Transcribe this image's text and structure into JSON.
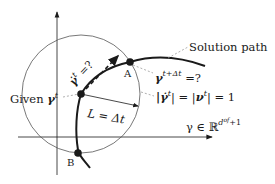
{
  "diagram": {
    "labels": {
      "solution_path": "Solution path",
      "given_prefix": "Given ",
      "given_symbol": "γ",
      "given_sup": "t",
      "next_point_symbol": "γ",
      "next_point_sup": "t+Δt",
      "next_point_suffix": " =?",
      "tangent_symbol": "γ̇",
      "tangent_sup": "t",
      "tangent_suffix": " =?",
      "norm_text_a": "|γ̇",
      "norm_sup_a": "t",
      "norm_text_b": "| = |",
      "norm_nu": "ν",
      "norm_sup_b": "t",
      "norm_text_c": "| = 1",
      "step_length": "L = Δt",
      "space_prefix": "γ ∈ ℝ",
      "space_sup": "d",
      "space_sup2": "of",
      "space_suffix": "+1",
      "point_a": "A",
      "point_b": "B"
    },
    "colors": {
      "ink": "#1a1a1a",
      "circle": "#555555",
      "leader": "#9a9a9a",
      "background": "#ffffff"
    }
  }
}
